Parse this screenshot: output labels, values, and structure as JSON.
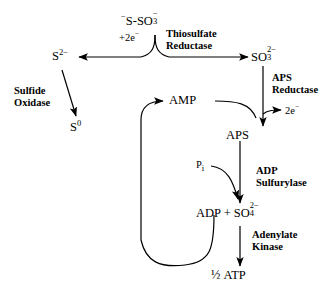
{
  "diagram": {
    "background_color": "#ffffff",
    "ink_color": "#000000",
    "nodes": {
      "thiosulfate": {
        "label": "S-SO",
        "charge_left": "−",
        "sub": "3",
        "sup": "−",
        "name": "thiosulfate"
      },
      "sulfide": {
        "label": "S",
        "sup": "2−",
        "name": "sulfide"
      },
      "elemental_sulfur": {
        "label": "S",
        "sup": "0",
        "name": "elemental-sulfur"
      },
      "sulfite": {
        "label": "SO",
        "sub": "3",
        "sup": "2−",
        "name": "sulfite"
      },
      "amp": {
        "label": "AMP",
        "name": "amp"
      },
      "aps": {
        "label": "APS",
        "name": "aps"
      },
      "adp_sulfate": {
        "label": "ADP + SO",
        "sub": "4",
        "sup": "2−",
        "name": "adp-plus-sulfate"
      },
      "atp": {
        "fraction": "½",
        "label": "ATP",
        "name": "half-atp"
      }
    },
    "enzymes": {
      "thiosulfate_reductase": {
        "line1": "Thiosulfate",
        "line2": "Reductase"
      },
      "sulfide_oxidase": {
        "line1": "Sulfide",
        "line2": "Oxidase"
      },
      "aps_reductase": {
        "line1": "APS",
        "line2": "Reductase"
      },
      "adp_sulfurylase": {
        "line1": "ADP",
        "line2": "Sulfurylase"
      },
      "adenylate_kinase": {
        "line1": "Adenylate",
        "line2": "Kinase"
      }
    },
    "cofactors": {
      "electrons_in": {
        "label": "+2e",
        "sup": "−"
      },
      "electrons_out": {
        "label": "2e",
        "sup": "−"
      },
      "phosphate": {
        "label": "P",
        "sub": "i"
      }
    }
  }
}
